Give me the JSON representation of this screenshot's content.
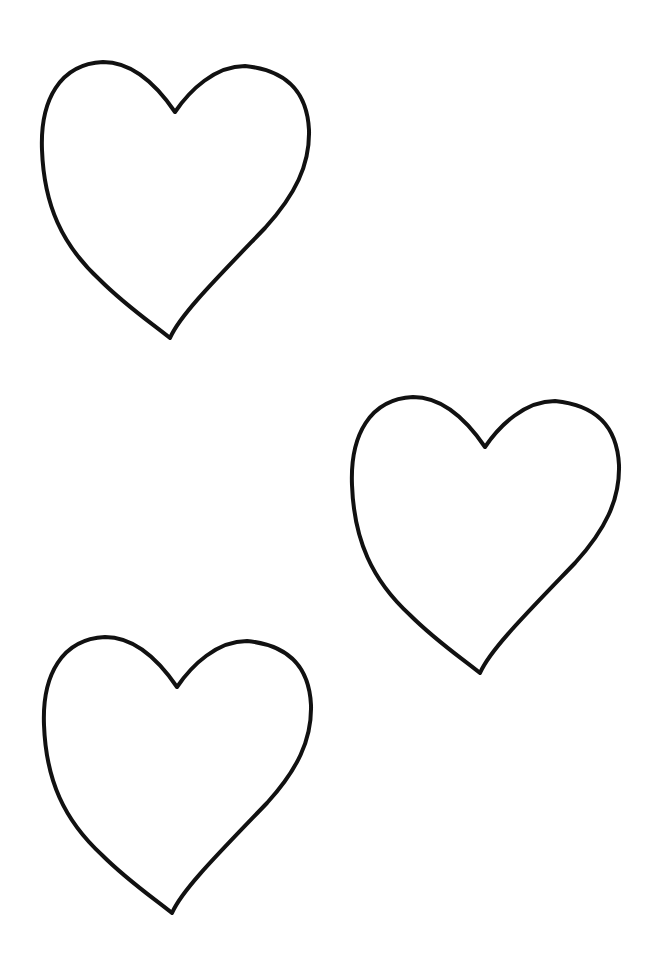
{
  "page": {
    "background": "#ffffff",
    "width": 662,
    "height": 956
  },
  "style": {
    "stroke_color": "#111111",
    "stroke_width": 4
  },
  "hearts": [
    {
      "name": "heart-top-left",
      "dx": 0,
      "dy": 0
    },
    {
      "name": "heart-middle-right",
      "dx": 310,
      "dy": 335
    },
    {
      "name": "heart-bottom-left",
      "dx": 2,
      "dy": 575
    }
  ]
}
